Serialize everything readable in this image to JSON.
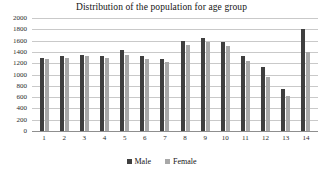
{
  "chart_data": {
    "type": "bar",
    "title": "Distribution of the population for age group",
    "xlabel": "",
    "ylabel": "",
    "ylim": [
      0,
      2000
    ],
    "y_ticks": [
      2000,
      1800,
      1600,
      1400,
      1200,
      1000,
      800,
      600,
      400,
      200,
      0
    ],
    "grid": true,
    "legend_position": "bottom",
    "categories": [
      "1",
      "2",
      "3",
      "4",
      "5",
      "6",
      "7",
      "8",
      "9",
      "10",
      "11",
      "12",
      "13",
      "14"
    ],
    "series": [
      {
        "name": "Male",
        "color": "#3f3f3f",
        "values": [
          1300,
          1330,
          1350,
          1330,
          1430,
          1330,
          1280,
          1600,
          1650,
          1570,
          1320,
          1130,
          750,
          1800
        ]
      },
      {
        "name": "Female",
        "color": "#a8a8a8",
        "values": [
          1280,
          1300,
          1320,
          1300,
          1350,
          1280,
          1230,
          1530,
          1570,
          1500,
          1240,
          950,
          620,
          1400
        ]
      }
    ]
  },
  "legend": {
    "items": [
      {
        "label": "Male",
        "color": "#3f3f3f"
      },
      {
        "label": "Female",
        "color": "#a8a8a8"
      }
    ]
  }
}
